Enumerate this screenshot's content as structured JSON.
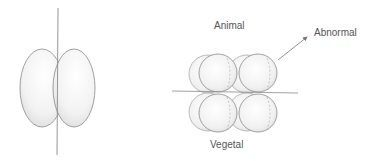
{
  "labels": {
    "animal": "Animal",
    "vegetal": "Vegetal",
    "abnormal": "Abnormal"
  },
  "colors": {
    "stroke": "#8a8a8a",
    "fill_light": "#ffffff",
    "fill_shade": "#d8d8d8",
    "text": "#555555"
  }
}
